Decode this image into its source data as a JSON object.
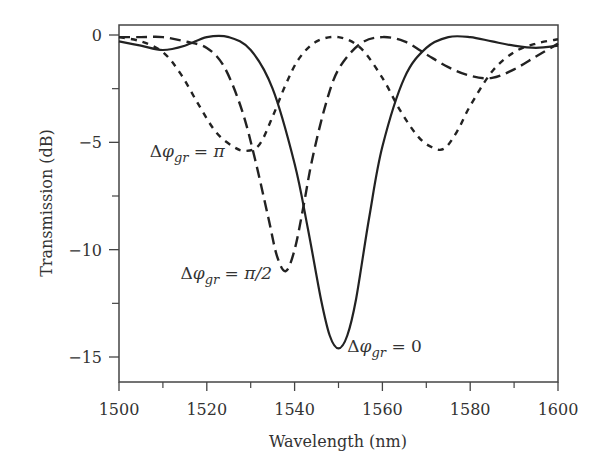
{
  "chart_data": {
    "type": "line",
    "title": "",
    "xlabel": "Wavelength (nm)",
    "ylabel": "Transmission (dB)",
    "xlim": [
      1500,
      1600
    ],
    "ylim": [
      -16,
      1
    ],
    "xticks": [
      1500,
      1520,
      1540,
      1560,
      1580,
      1600
    ],
    "xticks_minor": [
      1510,
      1530,
      1550,
      1570,
      1590
    ],
    "yticks": [
      0,
      -5,
      -10,
      -15
    ],
    "yticks_minor": [
      -2.5,
      -7.5,
      -12.5
    ],
    "grid": false,
    "legend": "none",
    "series": [
      {
        "name": "Δφgr = 0",
        "style": "solid",
        "x": [
          1500,
          1505,
          1510,
          1515,
          1520,
          1525,
          1530,
          1535,
          1540,
          1543,
          1546,
          1548,
          1550,
          1552,
          1554,
          1557,
          1560,
          1565,
          1570,
          1575,
          1580,
          1585,
          1590,
          1595,
          1600
        ],
        "y": [
          -0.3,
          -0.5,
          -0.7,
          -0.5,
          -0.1,
          -0.1,
          -0.7,
          -2.5,
          -6.0,
          -9.0,
          -12.3,
          -14.0,
          -14.6,
          -14.0,
          -12.3,
          -8.5,
          -5.2,
          -2.0,
          -0.6,
          -0.1,
          -0.1,
          -0.3,
          -0.5,
          -0.6,
          -0.5
        ]
      },
      {
        "name": "Δφgr = π/2",
        "style": "dashed",
        "x": [
          1500,
          1505,
          1510,
          1515,
          1520,
          1524,
          1528,
          1531,
          1534,
          1536,
          1538,
          1540,
          1542,
          1544,
          1547,
          1550,
          1555,
          1560,
          1565,
          1570,
          1575,
          1580,
          1585,
          1590,
          1595,
          1600
        ],
        "y": [
          -0.1,
          -0.1,
          -0.1,
          -0.3,
          -0.6,
          -1.5,
          -3.5,
          -5.8,
          -8.5,
          -10.3,
          -11.0,
          -10.0,
          -8.0,
          -5.8,
          -3.3,
          -1.6,
          -0.4,
          -0.1,
          -0.3,
          -0.9,
          -1.5,
          -1.9,
          -2.0,
          -1.6,
          -1.0,
          -0.4
        ]
      },
      {
        "name": "Δφgr = π",
        "style": "dotted",
        "x": [
          1500,
          1505,
          1510,
          1514,
          1518,
          1522,
          1526,
          1529,
          1532,
          1535,
          1538,
          1541,
          1545,
          1550,
          1555,
          1560,
          1564,
          1568,
          1571,
          1574,
          1577,
          1580,
          1585,
          1590,
          1595,
          1600
        ],
        "y": [
          -0.1,
          -0.3,
          -0.8,
          -1.8,
          -3.2,
          -4.5,
          -5.2,
          -5.4,
          -5.1,
          -3.8,
          -2.3,
          -1.1,
          -0.3,
          -0.1,
          -0.6,
          -2.0,
          -3.5,
          -4.7,
          -5.2,
          -5.3,
          -4.5,
          -3.3,
          -1.7,
          -0.8,
          -0.4,
          -0.2
        ]
      }
    ],
    "annotations": [
      {
        "id": "pi",
        "prefix": "Δ",
        "phi": "φ",
        "sub": "gr",
        "eq": " = ",
        "value": "π",
        "at": [
          1507,
          -5.4
        ]
      },
      {
        "id": "pi-half",
        "prefix": "Δ",
        "phi": "φ",
        "sub": "gr",
        "eq": " = ",
        "value": "π/2",
        "at": [
          1514,
          -11.1
        ]
      },
      {
        "id": "zero",
        "prefix": "Δ",
        "phi": "φ",
        "sub": "gr",
        "eq": " = ",
        "value": "0",
        "at": [
          1552,
          -14.5
        ]
      }
    ],
    "colors": {
      "line": "#222222",
      "axis": "#444444",
      "text": "#333333"
    }
  }
}
